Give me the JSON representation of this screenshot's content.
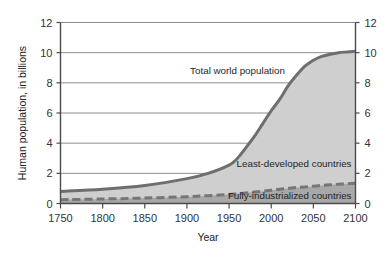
{
  "chart_data": {
    "type": "area",
    "title": "",
    "xlabel": "Year",
    "ylabel": "Human population, in billions",
    "xlim": [
      1750,
      2100
    ],
    "ylim": [
      0,
      12
    ],
    "grid": true,
    "legend_position": "inline-annotations",
    "xticks": [
      1750,
      1800,
      1850,
      1900,
      1950,
      2000,
      2050,
      2100
    ],
    "xtick_labels": [
      "1750",
      "1800",
      "1850",
      "1900",
      "1950",
      "2000",
      "2050",
      "2100"
    ],
    "yticks": [
      0,
      2,
      4,
      6,
      8,
      10,
      12
    ],
    "ytick_labels": [
      "0",
      "2",
      "4",
      "6",
      "8",
      "10",
      "12"
    ],
    "ytick_labels_right": [
      "0",
      "2",
      "4",
      "6",
      "8",
      "10",
      "12"
    ],
    "x": [
      1750,
      1800,
      1850,
      1900,
      1925,
      1950,
      1960,
      1970,
      1980,
      1990,
      2000,
      2010,
      2020,
      2030,
      2040,
      2050,
      2060,
      2070,
      2080,
      2090,
      2100
    ],
    "series": [
      {
        "name": "Total world population",
        "style": "solid-thick",
        "color": "#6e6e6e",
        "fill": "#cfcfcf",
        "values": [
          0.8,
          0.95,
          1.2,
          1.65,
          2.0,
          2.55,
          3.0,
          3.7,
          4.45,
          5.3,
          6.15,
          6.9,
          7.8,
          8.5,
          9.1,
          9.5,
          9.75,
          9.9,
          10.0,
          10.05,
          10.1
        ]
      },
      {
        "name": "Fully-industrialized countries",
        "style": "dashed-thick",
        "color": "#767676",
        "fill": "#a8a8a8",
        "values": [
          0.25,
          0.3,
          0.36,
          0.45,
          0.52,
          0.6,
          0.65,
          0.7,
          0.76,
          0.82,
          0.88,
          0.95,
          1.0,
          1.06,
          1.1,
          1.15,
          1.2,
          1.24,
          1.28,
          1.31,
          1.35
        ]
      }
    ],
    "annotations": [
      {
        "text": "Total world population",
        "x": 1960,
        "y": 8.6
      },
      {
        "text": "Least-developed countries",
        "x": 2048,
        "y": 2.45
      },
      {
        "text": "Fully-industrialized countries",
        "x": 2048,
        "y": 0.32
      }
    ],
    "colors": {
      "background": "#ffffff",
      "axis": "#4a4a4a",
      "grid": "#8c8c8c",
      "total_line": "#6e6e6e",
      "total_fill": "#cfcfcf",
      "industrial_line": "#767676",
      "industrial_fill": "#a8a8a8",
      "text": "#2b2b2b"
    }
  }
}
